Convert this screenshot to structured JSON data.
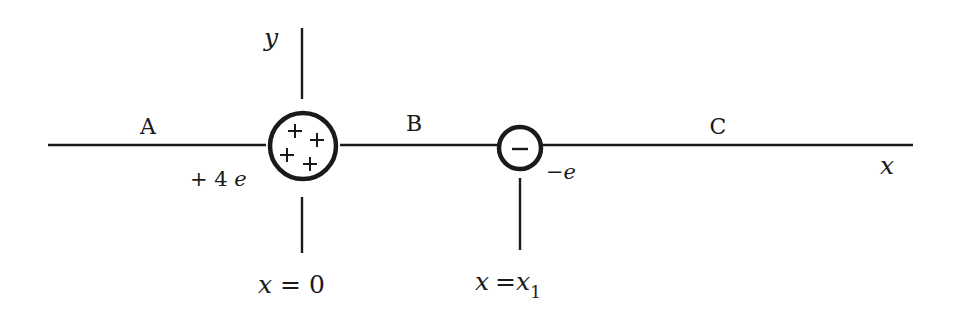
{
  "diagram": {
    "regions": [
      {
        "id": "A",
        "label": "A"
      },
      {
        "id": "B",
        "label": "B"
      },
      {
        "id": "C",
        "label": "C"
      }
    ],
    "axes": {
      "x_label": "x",
      "y_label": "y"
    },
    "charges": [
      {
        "id": "positive",
        "charge_label": "+ 4 e",
        "charge_prefix": "+ 4 ",
        "charge_unit": "e",
        "symbols": [
          "+",
          "+",
          "+",
          "+"
        ],
        "position_label_var": "x",
        "position_label_eq": "= 0",
        "position_label": "x = 0"
      },
      {
        "id": "negative",
        "charge_label": "−e",
        "charge_prefix": "−",
        "charge_unit": "e",
        "symbols": [
          "−"
        ],
        "position_label_var": "x",
        "position_label_eq": "=",
        "position_label_rhs": "x",
        "position_label_sub": "1",
        "position_label": "x = x1"
      }
    ],
    "colors": {
      "stroke": "#1a1a1a",
      "background": "#ffffff"
    }
  }
}
